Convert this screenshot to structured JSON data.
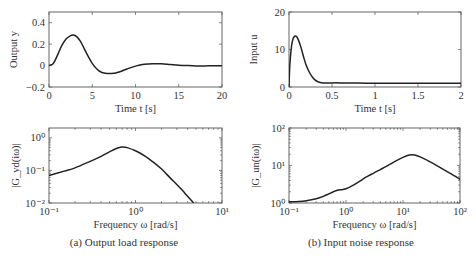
{
  "figure": {
    "captions": {
      "a": "(a) Output load response",
      "b": "(b) Input noise response"
    }
  },
  "chart_data": [
    {
      "id": "output-time",
      "type": "line",
      "title": "",
      "xlabel": "Time t [s]",
      "ylabel": "Output y",
      "xlim": [
        0,
        20
      ],
      "ylim": [
        -0.2,
        0.5
      ],
      "xticks": [
        0,
        5,
        10,
        15,
        20
      ],
      "xtick_labels": [
        "0",
        "5",
        "10",
        "15",
        "20"
      ],
      "yticks": [
        -0.2,
        0,
        0.2,
        0.4
      ],
      "ytick_labels": [
        "−0.2",
        "0",
        "0.2",
        "0.4"
      ],
      "grid": false,
      "x": [
        0,
        0.5,
        1,
        1.5,
        2,
        2.5,
        2.8,
        3.2,
        3.6,
        4,
        4.5,
        5,
        5.5,
        6,
        6.5,
        7,
        7.5,
        8,
        8.5,
        9,
        10,
        11,
        12,
        13,
        14,
        15,
        16,
        17,
        18,
        19,
        20
      ],
      "values": [
        0,
        0.02,
        0.1,
        0.19,
        0.25,
        0.28,
        0.285,
        0.27,
        0.23,
        0.17,
        0.09,
        0.02,
        -0.03,
        -0.06,
        -0.072,
        -0.075,
        -0.072,
        -0.062,
        -0.048,
        -0.032,
        -0.005,
        0.012,
        0.018,
        0.016,
        0.01,
        0.004,
        0.0,
        -0.003,
        -0.003,
        -0.002,
        -0.001
      ]
    },
    {
      "id": "input-time",
      "type": "line",
      "title": "",
      "xlabel": "Time t [s]",
      "ylabel": "Input u",
      "xlim": [
        0,
        2
      ],
      "ylim": [
        0,
        20
      ],
      "xticks": [
        0,
        0.5,
        1,
        1.5,
        2
      ],
      "xtick_labels": [
        "0",
        "0.5",
        "1",
        "1.5",
        "2"
      ],
      "yticks": [
        0,
        10,
        20
      ],
      "ytick_labels": [
        "0",
        "10",
        "20"
      ],
      "grid": false,
      "x": [
        0,
        0.01,
        0.03,
        0.05,
        0.07,
        0.09,
        0.11,
        0.14,
        0.17,
        0.2,
        0.24,
        0.28,
        0.32,
        0.36,
        0.4,
        0.45,
        0.5,
        0.6,
        0.8,
        1.0,
        1.2,
        1.5,
        1.8,
        2.0
      ],
      "values": [
        0,
        6,
        11,
        13,
        13.6,
        13.4,
        12.5,
        10.5,
        8,
        5.8,
        3.8,
        2.4,
        1.6,
        1.2,
        1.05,
        1.05,
        1.1,
        1.1,
        1.05,
        1.0,
        1.0,
        1.0,
        1.0,
        1.0
      ]
    },
    {
      "id": "gyd-bode",
      "type": "line",
      "title": "",
      "xlabel": "Frequency ω [rad/s]",
      "ylabel": "|G_yd(iω)|",
      "xscale": "log",
      "yscale": "log",
      "xlim": [
        0.1,
        10
      ],
      "ylim": [
        0.01,
        2
      ],
      "xticks": [
        0.1,
        1,
        10
      ],
      "xtick_labels": [
        "10⁻¹",
        "10⁰",
        "10¹"
      ],
      "yticks": [
        0.01,
        0.1,
        1
      ],
      "ytick_labels": [
        "10⁻²",
        "10⁻¹",
        "10⁰"
      ],
      "grid": false,
      "x": [
        0.1,
        0.15,
        0.2,
        0.3,
        0.4,
        0.5,
        0.6,
        0.7,
        0.8,
        1.0,
        1.3,
        1.6,
        2.0,
        2.5,
        3.0,
        3.5,
        4.0,
        4.7
      ],
      "values": [
        0.07,
        0.095,
        0.12,
        0.19,
        0.27,
        0.37,
        0.47,
        0.52,
        0.5,
        0.4,
        0.27,
        0.18,
        0.11,
        0.06,
        0.037,
        0.024,
        0.016,
        0.01
      ]
    },
    {
      "id": "gun-bode",
      "type": "line",
      "title": "",
      "xlabel": "Frequency ω [rad/s]",
      "ylabel": "|G_un(iω)|",
      "xscale": "log",
      "yscale": "log",
      "xlim": [
        0.1,
        100
      ],
      "ylim": [
        1,
        100
      ],
      "xticks": [
        0.1,
        1,
        10,
        100
      ],
      "xtick_labels": [
        "10⁻¹",
        "10⁰",
        "10¹",
        "10²"
      ],
      "yticks": [
        1,
        10,
        100
      ],
      "ytick_labels": [
        "10⁰",
        "10¹",
        "10²"
      ],
      "grid": false,
      "x": [
        0.1,
        0.15,
        0.2,
        0.3,
        0.4,
        0.5,
        0.6,
        0.7,
        0.8,
        1.0,
        1.3,
        1.7,
        2.2,
        3,
        4,
        5,
        7,
        10,
        13,
        16,
        20,
        30,
        50,
        70,
        100
      ],
      "values": [
        1.08,
        1.1,
        1.15,
        1.3,
        1.5,
        1.75,
        2.0,
        2.2,
        2.25,
        2.4,
        2.9,
        3.7,
        4.8,
        6.2,
        7.8,
        9.3,
        12.5,
        16.5,
        19,
        19,
        17,
        12.5,
        8,
        6,
        4.3
      ]
    }
  ]
}
